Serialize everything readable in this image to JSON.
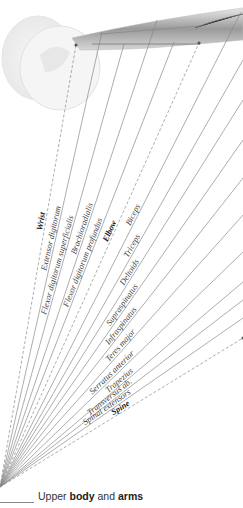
{
  "title": {
    "prefix": "Upper ",
    "bold1": "body",
    "mid": " and ",
    "bold2": "arms"
  },
  "origin": {
    "x": 0,
    "y": 487
  },
  "labels": [
    {
      "text": "Wrist",
      "bold": true,
      "dashed": true,
      "end": [
        76,
        45
      ]
    },
    {
      "text": "Extensor digitorum",
      "bold": false,
      "dashed": false,
      "end": [
        102,
        32
      ]
    },
    {
      "text": "Flexor digitorum superficialis",
      "bold": false,
      "dashed": false,
      "end": [
        124,
        44
      ]
    },
    {
      "text": "Brachioradialis",
      "bold": false,
      "dashed": false,
      "end": [
        157,
        20
      ]
    },
    {
      "text": "Flexor digitorum profundus",
      "bold": false,
      "dashed": false,
      "end": [
        174,
        42
      ]
    },
    {
      "text": "Elbow",
      "bold": true,
      "dashed": true,
      "end": [
        199,
        43
      ]
    },
    {
      "text": "Biceps",
      "bold": false,
      "dashed": false,
      "end": [
        241,
        12
      ]
    },
    {
      "text": "Triceps",
      "bold": false,
      "dashed": false,
      "end": [
        243,
        60
      ]
    },
    {
      "text": "Deltoids",
      "bold": false,
      "dashed": false,
      "end": [
        243,
        100
      ]
    },
    {
      "text": "Supraspinatus",
      "bold": false,
      "dashed": false,
      "end": [
        243,
        140
      ]
    },
    {
      "text": "Infraspinatus",
      "bold": false,
      "dashed": false,
      "end": [
        243,
        178
      ]
    },
    {
      "text": "Teres major",
      "bold": false,
      "dashed": false,
      "end": [
        243,
        215
      ]
    },
    {
      "text": "Serratus anterior",
      "bold": false,
      "dashed": false,
      "end": [
        243,
        252
      ]
    },
    {
      "text": "Trapezius",
      "bold": false,
      "dashed": false,
      "end": [
        243,
        282
      ]
    },
    {
      "text": "Transversus ab.",
      "bold": false,
      "dashed": false,
      "end": [
        243,
        300
      ]
    },
    {
      "text": "Spinal extensors",
      "bold": false,
      "dashed": false,
      "end": [
        243,
        318
      ]
    },
    {
      "text": "Spine",
      "bold": true,
      "dashed": true,
      "end": [
        243,
        338
      ]
    }
  ]
}
